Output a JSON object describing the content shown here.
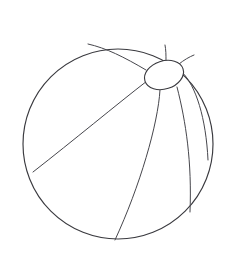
{
  "image": {
    "kind": "line-art-drawing",
    "subject": "beach ball",
    "style": "coloring book outline",
    "background_color": "#ffffff",
    "stroke_color": "#3a3a3f",
    "stroke_width": 1.15,
    "width": 231,
    "height": 272,
    "caption": ""
  },
  "shapes": {
    "ball": {
      "name": "ball-outline",
      "type": "circle",
      "cx": 118,
      "cy": 144,
      "r": 95,
      "fill": "#ffffff",
      "stroke": "#3a3a3f"
    },
    "pole_cap": {
      "name": "pole-cap-ellipse",
      "type": "ellipse",
      "cx": 164,
      "cy": 75,
      "rx": 20,
      "ry": 14,
      "rotation_deg": -18,
      "fill": "#ffffff",
      "stroke": "#3a3a3f"
    },
    "segments": [
      {
        "name": "segment-line-top-stub",
        "path": "M 166 61 C 166 55 166 50 165 45",
        "note": "short rib from cap top to upper circle arc"
      },
      {
        "name": "segment-line-upper-left",
        "path": "M 146 70 C 124 57 106 48 88 44",
        "note": "rib from cap left toward upper-left arc"
      },
      {
        "name": "segment-line-left-long",
        "path": "M 147 81 C 116 105 74 140 33 172",
        "note": "long rib sweeping to the left edge of the ball"
      },
      {
        "name": "segment-line-center-bottom",
        "path": "M 160 90 C 158 124 140 186 115 240",
        "note": "rib descending to the bottom of the ball"
      },
      {
        "name": "segment-line-right-inner",
        "path": "M 177 87 C 186 122 192 162 190 212",
        "note": "rib curving down the right side"
      },
      {
        "name": "segment-line-right-outer",
        "path": "M 182 72 C 196 86 206 118 208 160",
        "note": "rib hugging the right edge of the ball"
      },
      {
        "name": "segment-line-cap-upper-right",
        "path": "M 179 64 C 184 60 189 57 194 55",
        "note": "short rib from cap upper-right toward the arc"
      }
    ]
  },
  "labels": {
    "title": ""
  }
}
